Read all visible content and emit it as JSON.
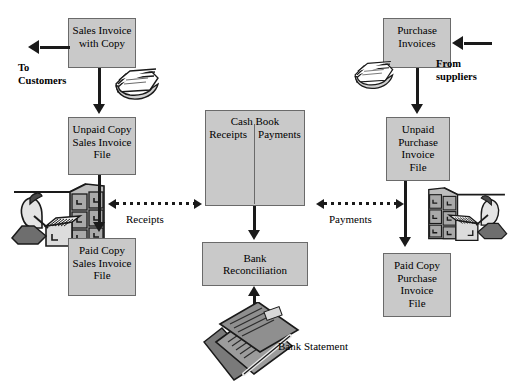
{
  "diagram": {
    "colors": {
      "box_fill": "#c9c9c9",
      "box_border": "#6a6a6a",
      "line": "#1a1a1a",
      "background": "#ffffff"
    },
    "boxes": {
      "sales_invoice": {
        "line1": "Sales Invoice",
        "line2": "with Copy"
      },
      "unpaid_sales": {
        "line1": "Unpaid Copy",
        "line2": "Sales Invoice",
        "line3": "File"
      },
      "paid_sales": {
        "line1": "Paid Copy",
        "line2": "Sales Invoice",
        "line3": "File"
      },
      "cash_book": {
        "title": "Cash Book",
        "left_column": "Receipts",
        "right_column": "Payments"
      },
      "bank_reconciliation": {
        "line1": "Bank",
        "line2": "Reconciliation"
      },
      "purchase_invoices": {
        "line1": "Purchase",
        "line2": "Invoices"
      },
      "unpaid_purchase": {
        "line1": "Unpaid",
        "line2": "Purchase",
        "line3": "Invoice",
        "line4": "File"
      },
      "paid_purchase": {
        "line1": "Paid Copy",
        "line2": "Purchase",
        "line3": "Invoice",
        "line4": "File"
      }
    },
    "labels": {
      "to_customers": "To\nCustomers",
      "from_suppliers": "From\n suppliers",
      "receipts_flow": "Receipts",
      "payments_flow": "Payments",
      "bank_statement": "Bank Statement"
    },
    "icons": {
      "sales_paper_stack": "paper-stack-icon",
      "purchase_paper_stack": "paper-stack-icon",
      "sales_clerk_filing": "clerk-filing-cabinet-icon",
      "purchase_clerk_filing": "clerk-filing-cabinet-icon",
      "bank_statement_art": "bank-statement-document-icon"
    }
  }
}
